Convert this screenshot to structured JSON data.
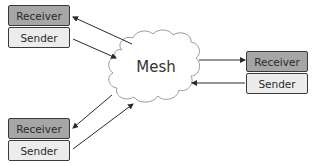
{
  "diagram": {
    "center": {
      "label": "Mesh",
      "shape": "cloud"
    },
    "nodes": [
      {
        "id": "top-left",
        "receiver_label": "Receiver",
        "sender_label": "Sender"
      },
      {
        "id": "right",
        "receiver_label": "Receiver",
        "sender_label": "Sender"
      },
      {
        "id": "bottom-left",
        "receiver_label": "Receiver",
        "sender_label": "Sender"
      }
    ],
    "edges": [
      {
        "from": "Mesh",
        "to": "top-left Receiver"
      },
      {
        "from": "top-left Sender",
        "to": "Mesh"
      },
      {
        "from": "Mesh",
        "to": "right Receiver"
      },
      {
        "from": "right Sender",
        "to": "Mesh"
      },
      {
        "from": "Mesh",
        "to": "bottom-left Receiver"
      },
      {
        "from": "bottom-left Sender",
        "to": "Mesh"
      }
    ],
    "colors": {
      "receiver_fill": "#a6a6a6",
      "sender_fill": "#ececec",
      "border": "#3a3a3a",
      "arrow": "#2a2a2a",
      "cloud_fill": "#ffffff",
      "cloud_stroke": "#9a9a9a"
    }
  }
}
